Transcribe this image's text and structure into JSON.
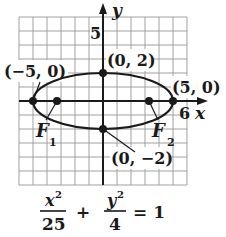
{
  "diagram": {
    "type": "ellipse-graph",
    "axes": {
      "x_label": "x",
      "y_label": "y",
      "x_tick_label": "6",
      "y_tick_label": "5"
    },
    "points": {
      "left_vertex": "(−5, 0)",
      "right_vertex": "(5, 0)",
      "top_covertex": "(0, 2)",
      "bottom_covertex": "(0, −2)"
    },
    "foci": {
      "f1": "F",
      "f1_sub": "1",
      "f2": "F",
      "f2_sub": "2"
    },
    "equation": {
      "num1": "x",
      "den1": "25",
      "plus": "+",
      "num2": "y",
      "den2": "4",
      "exp": "2",
      "equals": "= 1"
    },
    "colors": {
      "ink": "#1a1a1a",
      "grid": "#9a9a9a"
    }
  }
}
